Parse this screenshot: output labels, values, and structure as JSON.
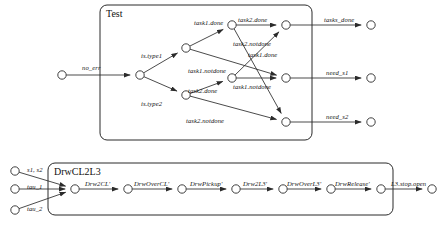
{
  "diagram": {
    "groups": [
      {
        "id": "test",
        "label": "Test",
        "x": 100,
        "y": 5,
        "w": 212,
        "h": 135
      },
      {
        "id": "drwcl2l3",
        "label": "DrwCL2L3",
        "x": 48,
        "y": 163,
        "w": 345,
        "h": 52
      }
    ],
    "nodes": [
      {
        "id": "in_noerr",
        "name": "input-no-err",
        "x": 62,
        "y": 75,
        "filled": false
      },
      {
        "id": "t_branch",
        "name": "test-branch",
        "x": 140,
        "y": 75,
        "filled": false
      },
      {
        "id": "t_type1",
        "name": "test-type1",
        "x": 186,
        "y": 48,
        "filled": false
      },
      {
        "id": "t_type2",
        "name": "test-type2",
        "x": 186,
        "y": 95,
        "filled": false
      },
      {
        "id": "t_mid1",
        "name": "test-mid-upper",
        "x": 232,
        "y": 25,
        "filled": false
      },
      {
        "id": "t_mid2",
        "name": "test-mid-lower",
        "x": 232,
        "y": 78,
        "filled": false
      },
      {
        "id": "t_done",
        "name": "test-tasks-done",
        "x": 286,
        "y": 25,
        "filled": false
      },
      {
        "id": "t_s1",
        "name": "test-need-s1",
        "x": 286,
        "y": 78,
        "filled": false
      },
      {
        "id": "t_s2",
        "name": "test-need-s2",
        "x": 286,
        "y": 122,
        "filled": false
      },
      {
        "id": "out_done",
        "name": "output-tasks-done",
        "x": 371,
        "y": 25,
        "filled": false
      },
      {
        "id": "out_s1",
        "name": "output-need-s1",
        "x": 371,
        "y": 78,
        "filled": false
      },
      {
        "id": "out_s2",
        "name": "output-need-s2",
        "x": 371,
        "y": 122,
        "filled": false
      },
      {
        "id": "d_in1",
        "name": "drw-input-top",
        "x": 15,
        "y": 171,
        "filled": false
      },
      {
        "id": "d_in2",
        "name": "drw-input-mid",
        "x": 15,
        "y": 189,
        "filled": false
      },
      {
        "id": "d_in3",
        "name": "drw-input-bottom",
        "x": 15,
        "y": 210,
        "filled": false
      },
      {
        "id": "d_n0",
        "name": "drw-node-start",
        "x": 75,
        "y": 189,
        "filled": false
      },
      {
        "id": "d_n1",
        "name": "drw-node-1",
        "x": 128,
        "y": 189,
        "filled": false
      },
      {
        "id": "d_n2",
        "name": "drw-node-2",
        "x": 182,
        "y": 189,
        "filled": false
      },
      {
        "id": "d_n3",
        "name": "drw-node-3",
        "x": 236,
        "y": 189,
        "filled": false
      },
      {
        "id": "d_n4",
        "name": "drw-node-4",
        "x": 283,
        "y": 189,
        "filled": false
      },
      {
        "id": "d_n5",
        "name": "drw-node-5",
        "x": 331,
        "y": 189,
        "filled": false
      },
      {
        "id": "d_n6",
        "name": "drw-node-6",
        "x": 381,
        "y": 189,
        "filled": false
      },
      {
        "id": "d_out",
        "name": "drw-output",
        "x": 432,
        "y": 189,
        "filled": false
      }
    ],
    "edges": [
      {
        "id": "e1",
        "name": "edge-no-err",
        "from": "in_noerr",
        "to": "t_branch",
        "label": "no_err",
        "lx": 82,
        "ly": 65
      },
      {
        "id": "e2",
        "name": "edge-is-type1",
        "from": "t_branch",
        "to": "t_type1",
        "label": "is.type1",
        "lx": 141,
        "ly": 53
      },
      {
        "id": "e3",
        "name": "edge-is-type2",
        "from": "t_branch",
        "to": "t_type2",
        "label": "is.type2",
        "lx": 141,
        "ly": 101
      },
      {
        "id": "e4",
        "name": "edge-task1-done",
        "from": "t_type1",
        "to": "t_mid1",
        "label": "task1.done",
        "lx": 194,
        "ly": 20
      },
      {
        "id": "e5",
        "name": "edge-task1-notdone",
        "from": "t_type1",
        "to": "t_s1",
        "label": "task1.notdone",
        "lx": 188,
        "ly": 68
      },
      {
        "id": "e6",
        "name": "edge-task2-done",
        "from": "t_type2",
        "to": "t_mid2",
        "label": "task2.done",
        "lx": 188,
        "ly": 88
      },
      {
        "id": "e7",
        "name": "edge-task2-notdone",
        "from": "t_type2",
        "to": "t_s2",
        "label": "task2.notdone",
        "lx": 186,
        "ly": 118
      },
      {
        "id": "e8",
        "name": "edge-task2-done-2",
        "from": "t_mid1",
        "to": "t_done",
        "label": "task2.done",
        "lx": 238,
        "ly": 17
      },
      {
        "id": "e9",
        "name": "edge-task2-notdone-2",
        "from": "t_mid1",
        "to": "t_s2",
        "label": "task2.notdone",
        "lx": 233,
        "ly": 41
      },
      {
        "id": "e10",
        "name": "edge-task1-done-2",
        "from": "t_mid2",
        "to": "t_done",
        "label": "task1.done",
        "lx": 248,
        "ly": 52
      },
      {
        "id": "e11",
        "name": "edge-task1-notdone-2",
        "from": "t_mid2",
        "to": "t_s1",
        "label": "task1.notdone",
        "lx": 233,
        "ly": 84
      },
      {
        "id": "e12",
        "name": "edge-tasks-done-out",
        "from": "t_done",
        "to": "out_done",
        "label": "tasks_done",
        "lx": 324,
        "ly": 17
      },
      {
        "id": "e13",
        "name": "edge-need-s1-out",
        "from": "t_s1",
        "to": "out_s1",
        "label": "need_s1",
        "lx": 326,
        "ly": 70
      },
      {
        "id": "e14",
        "name": "edge-need-s2-out",
        "from": "t_s2",
        "to": "out_s2",
        "label": "need_s2",
        "lx": 326,
        "ly": 114
      },
      {
        "id": "e15",
        "name": "edge-drw-in-top",
        "from": "d_in1",
        "to": "d_n0",
        "label": "s1, s2",
        "lx": 27,
        "ly": 167
      },
      {
        "id": "e16",
        "name": "edge-drw-in-mid",
        "from": "d_in2",
        "to": "d_n0",
        "label": "tau_1",
        "lx": 27,
        "ly": 184
      },
      {
        "id": "e17",
        "name": "edge-drw-in-bottom",
        "from": "d_in3",
        "to": "d_n0",
        "label": "tau_2",
        "lx": 27,
        "ly": 206
      },
      {
        "id": "e18",
        "name": "edge-drw2cl",
        "from": "d_n0",
        "to": "d_n1",
        "label": "Drw2CL'",
        "lx": 85,
        "ly": 181
      },
      {
        "id": "e19",
        "name": "edge-drwovercl",
        "from": "d_n1",
        "to": "d_n2",
        "label": "DrwOverCL'",
        "lx": 134,
        "ly": 181
      },
      {
        "id": "e20",
        "name": "edge-drwpickup",
        "from": "d_n2",
        "to": "d_n3",
        "label": "DrwPickup'",
        "lx": 190,
        "ly": 181
      },
      {
        "id": "e21",
        "name": "edge-drw2l3",
        "from": "d_n3",
        "to": "d_n4",
        "label": "Drw2L3'",
        "lx": 243,
        "ly": 181
      },
      {
        "id": "e22",
        "name": "edge-drwoverl3",
        "from": "d_n4",
        "to": "d_n5",
        "label": "DrwOverL3'",
        "lx": 287,
        "ly": 181
      },
      {
        "id": "e23",
        "name": "edge-drwrelease",
        "from": "d_n5",
        "to": "d_n6",
        "label": "DrwRelease'",
        "lx": 335,
        "ly": 181
      },
      {
        "id": "e24",
        "name": "edge-l3-stop-open",
        "from": "d_n6",
        "to": "d_out",
        "label": "L3.stop.open",
        "lx": 391,
        "ly": 181
      }
    ],
    "colors": {
      "stroke": "#2b2b2b",
      "text": "#111111",
      "background": "#ffffff"
    }
  }
}
